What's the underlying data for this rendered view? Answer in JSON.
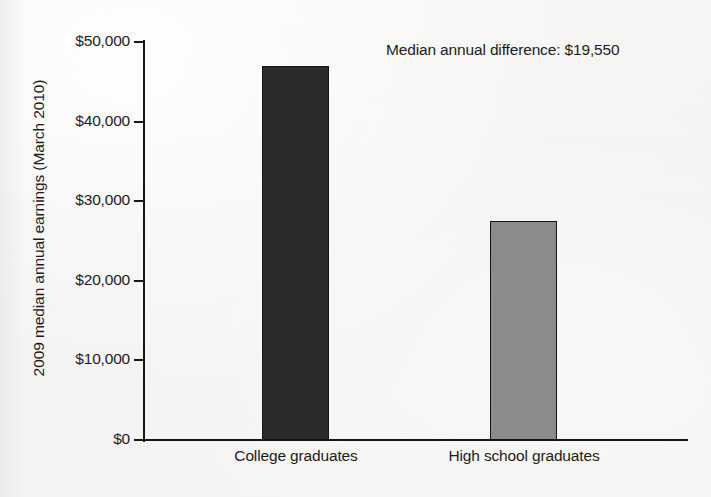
{
  "chart_data": {
    "type": "bar",
    "title": "",
    "subtitle": "",
    "xlabel": "",
    "ylabel": "2009 median annual earnings (March 2010)",
    "categories": [
      "College graduates",
      "High school graduates"
    ],
    "values": [
      47000,
      27450
    ],
    "ylim": [
      0,
      50000
    ],
    "ytick_values": [
      0,
      10000,
      20000,
      30000,
      40000,
      50000
    ],
    "ytick_labels": [
      "$0",
      "$10,000",
      "$20,000",
      "$30,000",
      "$40,000",
      "$50,000"
    ],
    "grid": false,
    "legend": false,
    "legend_position": "none",
    "bar_colors": [
      "#2b2b2b",
      "#8b8b8b"
    ],
    "annotations": [
      {
        "name": "median-annual-difference",
        "text": "Median annual difference: $19,550",
        "value": 19550
      }
    ]
  },
  "axes": {
    "y_title": "2009 median annual earnings (March 2010)",
    "y_ticks": [
      {
        "label": "$50,000",
        "value": 50000
      },
      {
        "label": "$40,000",
        "value": 40000
      },
      {
        "label": "$30,000",
        "value": 30000
      },
      {
        "label": "$20,000",
        "value": 20000
      },
      {
        "label": "$10,000",
        "value": 10000
      },
      {
        "label": "$0",
        "value": 0
      }
    ],
    "x_categories": [
      {
        "label": "College graduates"
      },
      {
        "label": "High school graduates"
      }
    ]
  },
  "annotation": {
    "difference_text": "Median annual difference: $19,550"
  },
  "caption": {
    "remnant": ""
  },
  "colors": {
    "bar_dark": "#2b2b2b",
    "bar_light": "#8b8b8b",
    "axis": "#161616",
    "text": "#1c1c1c",
    "background": "#f5f4f2"
  }
}
